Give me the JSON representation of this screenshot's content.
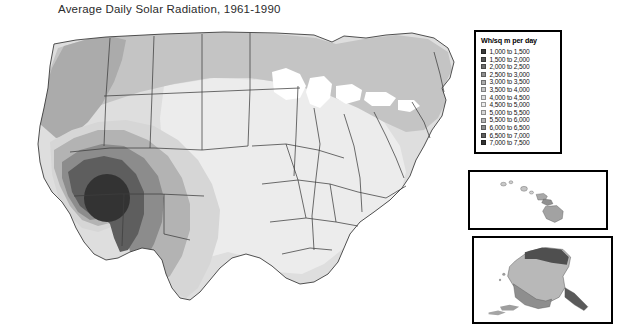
{
  "title": "Average Daily Solar Radiation, 1961-1990",
  "legend": {
    "header": "Wh/sq m per day",
    "entries": [
      {
        "label": "1,000 to 1,500",
        "color": "#3a3a3a",
        "low": 1000,
        "high": 1500
      },
      {
        "label": "1,500 to 2,000",
        "color": "#555555",
        "low": 1500,
        "high": 2000
      },
      {
        "label": "2,000 to 2,500",
        "color": "#6e6e6e",
        "low": 2000,
        "high": 2500
      },
      {
        "label": "2,500 to 3,000",
        "color": "#8f8f8f",
        "low": 2500,
        "high": 3000
      },
      {
        "label": "3,000 to 3,500",
        "color": "#ababab",
        "low": 3000,
        "high": 3500
      },
      {
        "label": "3,500 to 4,000",
        "color": "#c4c4c4",
        "low": 3500,
        "high": 4000
      },
      {
        "label": "4,000 to 4,500",
        "color": "#dedede",
        "low": 4000,
        "high": 4500
      },
      {
        "label": "4,500 to 5,000",
        "color": "#ececec",
        "low": 4500,
        "high": 5000
      },
      {
        "label": "5,000 to 5,500",
        "color": "#d6d6d6",
        "low": 5000,
        "high": 5500
      },
      {
        "label": "5,500 to 6,000",
        "color": "#b3b3b3",
        "low": 5500,
        "high": 6000
      },
      {
        "label": "6,000 to 6,500",
        "color": "#8c8c8c",
        "low": 6000,
        "high": 6500
      },
      {
        "label": "6,500 to 7,000",
        "color": "#5e5e5e",
        "low": 6500,
        "high": 7000
      },
      {
        "label": "7,000 to 7,500",
        "color": "#333333",
        "low": 7000,
        "high": 7500
      }
    ]
  },
  "map": {
    "name": "contiguous-united-states",
    "lake_color": "#ffffff",
    "border_color": "#3d3d3d",
    "regions": [
      {
        "name": "pacific-northwest",
        "band": "3,500 to 4,000"
      },
      {
        "name": "northern-plains",
        "band": "4,000 to 4,500"
      },
      {
        "name": "great-lakes",
        "band": "3,500 to 4,000"
      },
      {
        "name": "northeast",
        "band": "3,500 to 4,000"
      },
      {
        "name": "central-plains",
        "band": "4,500 to 5,000"
      },
      {
        "name": "southeast",
        "band": "4,500 to 5,000"
      },
      {
        "name": "southern-texas",
        "band": "5,000 to 5,500"
      },
      {
        "name": "great-basin",
        "band": "5,500 to 6,000"
      },
      {
        "name": "colorado-plateau",
        "band": "6,000 to 6,500"
      },
      {
        "name": "mojave-sonoran",
        "band": "6,500 to 7,000"
      },
      {
        "name": "desert-southwest-core",
        "band": "7,000 to 7,500"
      }
    ]
  },
  "insets": [
    {
      "name": "hawaii",
      "band_high": "5,500 to 6,000"
    },
    {
      "name": "alaska",
      "band_high": "2,500 to 3,000"
    }
  ]
}
